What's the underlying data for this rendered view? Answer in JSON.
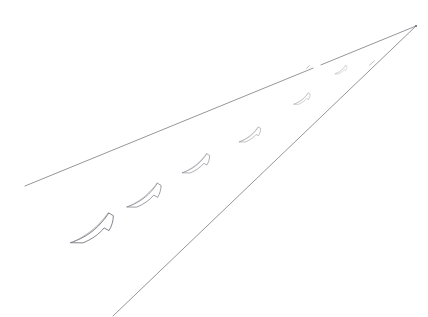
{
  "scene": {
    "title": "Perspective sketch of a receding path with crescent markings",
    "medium": "pencil line drawing",
    "background_color": "#ffffff",
    "line_color": "#8a8a90",
    "shape_stroke_color": "#76767e",
    "shape_fill_color": "#ffffff",
    "canvas": {
      "width": 428,
      "height": 317
    }
  },
  "vanishing_point": {
    "label": "vanishing point",
    "x": 416,
    "y": 26
  },
  "guides": [
    {
      "name": "upper-edge-line",
      "label": "upper path edge",
      "x1": 25,
      "y1": 186,
      "x2": 416,
      "y2": 26,
      "broken": true,
      "break_start_x": 313,
      "break_end_x": 321
    },
    {
      "name": "lower-edge-line",
      "label": "lower path edge",
      "x1": 113,
      "y1": 316,
      "x2": 416,
      "y2": 26,
      "broken": false
    }
  ],
  "tick_marks": [
    {
      "name": "tick-upper-line",
      "x": 308,
      "y": 67,
      "length": 3
    },
    {
      "name": "tick-lower-line",
      "x": 372,
      "y": 63,
      "length": 5
    }
  ],
  "crescents": [
    {
      "index": 1,
      "label": "crescent-1",
      "cx": 92,
      "cy": 229,
      "scale": 1.0,
      "rotation": -8
    },
    {
      "index": 2,
      "label": "crescent-2",
      "cx": 144,
      "cy": 196,
      "scale": 0.8,
      "rotation": -8
    },
    {
      "index": 3,
      "label": "crescent-3",
      "cx": 196,
      "cy": 164,
      "scale": 0.64,
      "rotation": -8
    },
    {
      "index": 4,
      "label": "crescent-4",
      "cx": 250,
      "cy": 135,
      "scale": 0.5,
      "rotation": -8
    },
    {
      "index": 5,
      "label": "crescent-5",
      "cx": 302,
      "cy": 99,
      "scale": 0.38,
      "rotation": -8
    },
    {
      "index": 6,
      "label": "crescent-6",
      "cx": 341,
      "cy": 70,
      "scale": 0.28,
      "rotation": -8
    }
  ],
  "counts": {
    "crescent_count": 6,
    "guide_line_count": 2,
    "tick_mark_count": 2
  }
}
